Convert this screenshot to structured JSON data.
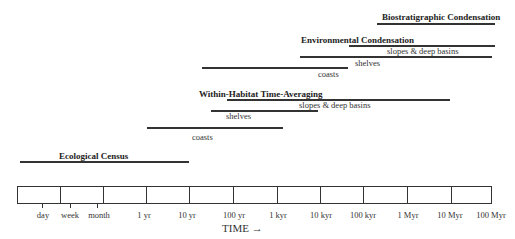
{
  "diagram": {
    "title_labels": {
      "biostratigraphic": "Biostratigraphic Condensation",
      "environmental": "Environmental Condensation",
      "within_habitat": "Within-Habitat  Time-Averaging",
      "ecological": "Ecological Census"
    },
    "ranges": [
      {
        "category": "Biostratigraphic Condensation",
        "label": "",
        "from": "1 Myr",
        "to": "100 Myr"
      },
      {
        "category": "Environmental Condensation",
        "label": "slopes & deep basins",
        "from": "100 kyr",
        "to": "100 Myr"
      },
      {
        "category": "Environmental Condensation",
        "label": "shelves",
        "from": "10 kyr",
        "to": "100 Myr"
      },
      {
        "category": "Environmental Condensation",
        "label": "coasts",
        "from": "100 yr",
        "to": "100 kyr"
      },
      {
        "category": "Within-Habitat Time-Averaging",
        "label": "slopes & deep basins",
        "from": "100 yr",
        "to": "10 Myr"
      },
      {
        "category": "Within-Habitat Time-Averaging",
        "label": "shelves",
        "from": "100 yr",
        "to": "10 kyr"
      },
      {
        "category": "Within-Habitat Time-Averaging",
        "label": "coasts",
        "from": "1 yr",
        "to": "1 kyr"
      },
      {
        "category": "Ecological Census",
        "label": "",
        "from": "day",
        "to": "10 yr"
      }
    ],
    "labels": {
      "env_slopes": "slopes & deep basins",
      "env_shelves": "shelves",
      "env_coasts": "coasts",
      "wh_slopes": "slopes & deep basins",
      "wh_shelves": "shelves",
      "wh_coasts": "coasts"
    },
    "axis": {
      "ticks": [
        "day",
        "week",
        "month",
        "1 yr",
        "10 yr",
        "100 yr",
        "1 kyr",
        "10 kyr",
        "100 kyr",
        "1 Myr",
        "10 Myr",
        "100 Myr"
      ],
      "title": "TIME →"
    }
  }
}
